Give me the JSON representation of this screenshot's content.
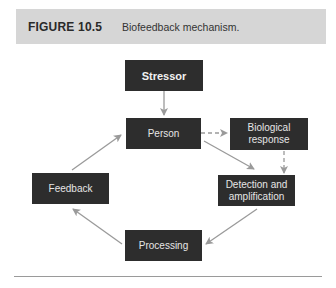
{
  "figure": {
    "number": "FIGURE 10.5",
    "caption": "Biofeedback mechanism."
  },
  "nodes": {
    "stressor": "Stressor",
    "person": "Person",
    "biological": "Biological response",
    "detection": "Detection and amplification",
    "feedback": "Feedback",
    "processing": "Processing"
  },
  "edges": [
    {
      "from": "Stressor",
      "to": "Person",
      "style": "solid"
    },
    {
      "from": "Person",
      "to": "Biological response",
      "style": "dashed"
    },
    {
      "from": "Biological response",
      "to": "Detection and amplification",
      "style": "dashed"
    },
    {
      "from": "Person",
      "to": "Detection and amplification",
      "style": "solid"
    },
    {
      "from": "Detection and amplification",
      "to": "Processing",
      "style": "solid"
    },
    {
      "from": "Processing",
      "to": "Feedback",
      "style": "solid"
    },
    {
      "from": "Feedback",
      "to": "Person",
      "style": "solid"
    }
  ],
  "colors": {
    "box": "#2d2d2d",
    "arrow": "#9a9a9a",
    "header": "#d6d6d6"
  }
}
